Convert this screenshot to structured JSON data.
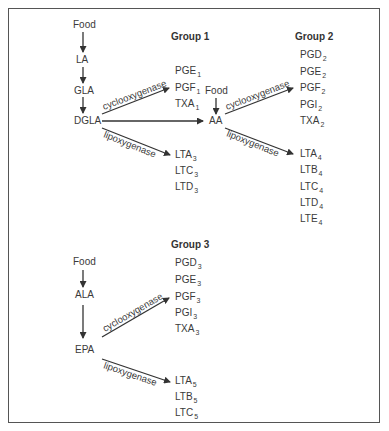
{
  "diagram": {
    "type": "eicosanoid-pathway",
    "sources": {
      "food_label": "Food",
      "omega6": [
        "LA",
        "GLA",
        "DGLA"
      ],
      "aa": "AA",
      "omega3": [
        "ALA",
        "EPA"
      ]
    },
    "enzymes": {
      "cox": "cyclooxygenase",
      "lox": "lipoxygenase"
    },
    "group1": {
      "title": "Group 1",
      "cox_products": [
        {
          "base": "PGE",
          "sub": "1"
        },
        {
          "base": "PGF",
          "sub": "1"
        },
        {
          "base": "TXA",
          "sub": "1"
        }
      ],
      "lox_products": [
        {
          "base": "LTA",
          "sub": "3"
        },
        {
          "base": "LTC",
          "sub": "3"
        },
        {
          "base": "LTD",
          "sub": "3"
        }
      ]
    },
    "group2": {
      "title": "Group 2",
      "cox_products": [
        {
          "base": "PGD",
          "sub": "2"
        },
        {
          "base": "PGE",
          "sub": "2"
        },
        {
          "base": "PGF",
          "sub": "2"
        },
        {
          "base": "PGI",
          "sub": "2"
        },
        {
          "base": "TXA",
          "sub": "2"
        }
      ],
      "lox_products": [
        {
          "base": "LTA",
          "sub": "4"
        },
        {
          "base": "LTB",
          "sub": "4"
        },
        {
          "base": "LTC",
          "sub": "4"
        },
        {
          "base": "LTD",
          "sub": "4"
        },
        {
          "base": "LTE",
          "sub": "4"
        }
      ]
    },
    "group3": {
      "title": "Group 3",
      "cox_products": [
        {
          "base": "PGD",
          "sub": "3"
        },
        {
          "base": "PGE",
          "sub": "3"
        },
        {
          "base": "PGF",
          "sub": "3"
        },
        {
          "base": "PGI",
          "sub": "3"
        },
        {
          "base": "TXA",
          "sub": "3"
        }
      ],
      "lox_products": [
        {
          "base": "LTA",
          "sub": "5"
        },
        {
          "base": "LTB",
          "sub": "5"
        },
        {
          "base": "LTC",
          "sub": "5"
        }
      ]
    },
    "colors": {
      "line": "#333333",
      "text": "#3a3a3a",
      "border": "#555555"
    }
  }
}
